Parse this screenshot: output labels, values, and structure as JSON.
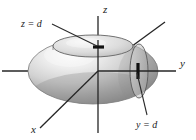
{
  "figure": {
    "background_color": "#ffffff",
    "axes": [
      {
        "name": "x",
        "label": "x",
        "label_x": 32,
        "label_y": 132,
        "direction": "lower-left"
      },
      {
        "name": "y",
        "label": "y",
        "label_x": 180,
        "label_y": 66,
        "direction": "right"
      },
      {
        "name": "z",
        "label": "z",
        "label_x": 103,
        "label_y": 12,
        "direction": "up"
      }
    ],
    "annotations": [
      {
        "name": "z-equals-d",
        "label": "z = d",
        "label_x": 22,
        "label_y": 25,
        "leader_from_x": 51,
        "leader_from_y": 25,
        "leader_to_x": 95,
        "leader_to_y": 46,
        "tick_x": 98,
        "tick_y": 47,
        "tick_orientation": "horizontal"
      },
      {
        "name": "y-equals-d",
        "label": "y = d",
        "label_x": 137,
        "label_y": 126,
        "leader_from_x": 148,
        "leader_from_y": 116,
        "leader_to_x": 140,
        "leader_to_y": 77,
        "tick_x": 138,
        "tick_y": 71,
        "tick_orientation": "vertical"
      }
    ],
    "solid": {
      "name": "ellipsoid",
      "center_x": 93,
      "center_y": 71,
      "radius_x": 65,
      "radius_y": 33,
      "fill_light": "#f2f2f2",
      "fill_mid": "#c9c9c9",
      "fill_dark": "#8f8f8f",
      "outline_color": "#6e6e6e"
    },
    "cross_sections": [
      {
        "name": "horizontal-section-z-d",
        "type": "ellipse",
        "cx": 93,
        "cy": 46,
        "rx": 40,
        "ry": 11,
        "plane": "z = d"
      },
      {
        "name": "vertical-section-y-d",
        "type": "ellipse",
        "cx": 139,
        "cy": 71,
        "rx": 9,
        "ry": 27,
        "plane": "y = d"
      }
    ],
    "colors": {
      "axis": "#262626",
      "text": "#1a1a1a",
      "section_stroke": "#4a4a4a",
      "tick": "#111111"
    }
  }
}
